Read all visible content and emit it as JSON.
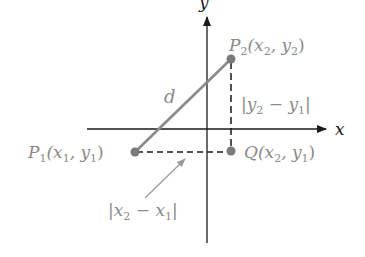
{
  "diagram": {
    "type": "distance-formula-coordinate-plane",
    "colors": {
      "axis": "#1a1a1a",
      "segment": "#8a8a8a",
      "point": "#7a7a7a",
      "dashed": "#1a1a1a",
      "label": "#8a8a8a",
      "pointer_arrow": "#9a9a9a"
    },
    "axes": {
      "x_label": "x",
      "y_label": "y"
    },
    "points": {
      "p1": {
        "name": "P",
        "sub": "1",
        "coords_open": "(x",
        "coord1_sub": "1",
        "sep": ", y",
        "coord2_sub": "1",
        "close": ")"
      },
      "p2": {
        "name": "P",
        "sub": "2",
        "coords_open": "(x",
        "coord1_sub": "2",
        "sep": ", y",
        "coord2_sub": "2",
        "close": ")"
      },
      "q": {
        "name": "Q",
        "coords_open": "(x",
        "coord1_sub": "2",
        "sep": ", y",
        "coord2_sub": "1",
        "close": ")"
      }
    },
    "distance_label": "d",
    "vertical_leg": {
      "open": "|y",
      "a_sub": "2",
      "minus": " − y",
      "b_sub": "1",
      "close": "|"
    },
    "horizontal_leg": {
      "open": "|x",
      "a_sub": "2",
      "minus": " − x",
      "b_sub": "1",
      "close": "|"
    }
  }
}
